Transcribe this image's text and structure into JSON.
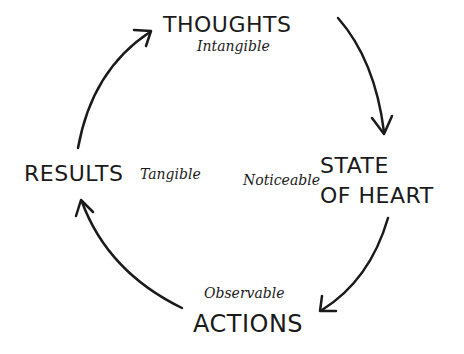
{
  "diagram": {
    "type": "cycle",
    "nodes": [
      {
        "id": "thoughts",
        "label": "THOUGHTS",
        "sub": "Intangible"
      },
      {
        "id": "state",
        "label_line1": "STATE",
        "label_line2": "OF HEART",
        "sub": "Noticeable"
      },
      {
        "id": "actions",
        "label": "ACTIONS",
        "sub": "Observable"
      },
      {
        "id": "results",
        "label": "RESULTS",
        "sub": "Tangible"
      }
    ],
    "edges": [
      {
        "from": "thoughts",
        "to": "state"
      },
      {
        "from": "state",
        "to": "actions"
      },
      {
        "from": "actions",
        "to": "results"
      },
      {
        "from": "results",
        "to": "thoughts"
      }
    ],
    "colors": {
      "ink": "#1a1a1a",
      "background": "#ffffff"
    }
  }
}
